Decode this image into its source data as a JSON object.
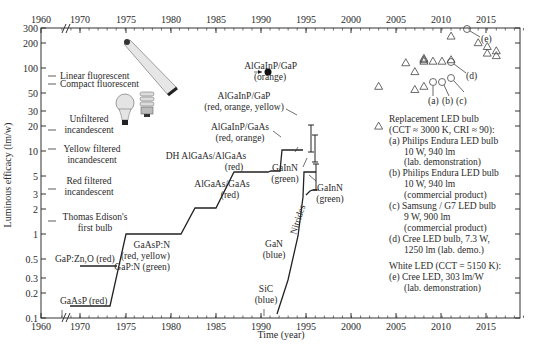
{
  "chart_data": {
    "type": "line",
    "title": "",
    "xlabel": "Time (year)",
    "ylabel": "Luminous efficacy (lm/w)",
    "y_scale": "log",
    "ylim": [
      0.1,
      300
    ],
    "xlim": [
      1960,
      2019
    ],
    "x_ticks": [
      "1960",
      "1970",
      "1975",
      "1980",
      "1985",
      "1990",
      "1995",
      "2000",
      "2005",
      "2010",
      "2015"
    ],
    "x_ticks_top": [
      "1960",
      "1970",
      "1975",
      "1980",
      "1985",
      "1990",
      "1995",
      "2000",
      "2005",
      "2010",
      "2015"
    ],
    "y_ticks": [
      "0.1",
      "0.2",
      "0.3",
      "0.5",
      "1",
      "2",
      "3",
      "5",
      "10",
      "20",
      "30",
      "50",
      "100",
      "200",
      "300"
    ],
    "axis_break": "between 1960 and 1970",
    "grid": false,
    "reference_lamps": [
      {
        "label": "Linear fluorescent",
        "value": 80
      },
      {
        "label": "Compact fluorescent",
        "value": 65
      },
      {
        "label": "Unfiltered incandescent",
        "value": 17
      },
      {
        "label": "Yellow filtered incandescent",
        "value": 10.5
      },
      {
        "label": "Red filtered incandescent",
        "value": 3.5
      },
      {
        "label": "Thomas Edison's first bulb",
        "value": 1.4
      }
    ],
    "series": [
      {
        "name": "Conventional LED (GaAsP → AlGaInP/GaP)",
        "points": [
          [
            1968,
            0.14
          ],
          [
            1973,
            0.14
          ],
          [
            1975,
            1
          ],
          [
            1981,
            1
          ],
          [
            1983,
            2
          ],
          [
            1986,
            2
          ],
          [
            1988,
            8
          ],
          [
            1992,
            8
          ],
          [
            1992.2,
            9
          ],
          [
            1993,
            9
          ],
          [
            1993.5,
            25
          ],
          [
            1997,
            25
          ]
        ]
      },
      {
        "name": "GaP:Zn,O (red)",
        "points": [
          [
            1969,
            0.4
          ],
          [
            1974,
            0.4
          ]
        ]
      },
      {
        "name": "Nitrides",
        "points": [
          [
            1992,
            0.12
          ],
          [
            1994,
            1.5
          ],
          [
            1995.5,
            10
          ],
          [
            1995.8,
            20
          ],
          [
            1997,
            20
          ]
        ]
      },
      {
        "name": "GaInN (green) lower",
        "points": [
          [
            1996,
            3
          ],
          [
            1996.5,
            5
          ],
          [
            1997,
            5
          ]
        ]
      }
    ],
    "error_bars": [
      {
        "x": 1997,
        "low": 25,
        "high": 50
      },
      {
        "x": 1997,
        "low": 10,
        "high": 20
      },
      {
        "x": 1997,
        "low": 5,
        "high": 15
      }
    ],
    "highlight_point": {
      "label": "AlGaInP/GaP (orange)",
      "x": 2000,
      "y": 100
    },
    "triangles": [
      [
        2003,
        20
      ],
      [
        2003,
        60
      ],
      [
        2006,
        115
      ],
      [
        2007,
        90
      ],
      [
        2007,
        55
      ],
      [
        2008,
        60
      ],
      [
        2008,
        130
      ],
      [
        2008,
        125
      ],
      [
        2008,
        120
      ],
      [
        2009,
        120
      ],
      [
        2010,
        120
      ],
      [
        2011,
        125
      ],
      [
        2011,
        240
      ],
      [
        2014,
        200
      ],
      [
        2015,
        180
      ],
      [
        2015,
        150
      ],
      [
        2016,
        160
      ],
      [
        2016,
        140
      ]
    ],
    "circles": [
      {
        "id": "(a)",
        "x": 2010,
        "y": 95
      },
      {
        "id": "(b)",
        "x": 2011,
        "y": 95
      },
      {
        "id": "(c)",
        "x": 2012,
        "y": 100
      },
      {
        "id": "(d)",
        "x": 2012,
        "y": 150
      },
      {
        "id": "(e)",
        "x": 2014,
        "y": 303
      }
    ],
    "annotations": [
      "GaAsP (red)",
      "GaP:Zn,O (red)",
      "GaAsP:N (red, yellow)",
      "GaP:N (green)",
      "AlGaAs/GaAs (red)",
      "DH AlGaAs/AlGaAs (red)",
      "AlGaInP/GaAs (red, orange)",
      "AlGaInP/GaP (red, orange, yellow)",
      "GaInN (green)",
      "GaN (blue)",
      "SiC (blue)",
      "Nitrides",
      "AlGaInP/GaP (orange)"
    ]
  },
  "labels": {
    "xlabel": "Time (year)",
    "ylabel": "Luminous efficacy (lm/w)",
    "lamps": {
      "linear": "Linear fluorescent",
      "compact": "Compact fluorescent",
      "unfiltered1": "Unfiltered",
      "unfiltered2": "incandescent",
      "yellow1": "Yellow filtered",
      "yellow2": "incandescent",
      "red1": "Red filtered",
      "red2": "incandescent",
      "edison1": "Thomas Edison's",
      "edison2": "first bulb"
    },
    "led": {
      "gaasp": "GaAsP (red)",
      "gapzno": "GaP:Zn,O (red)",
      "gaaspn1": "GaAsP:N",
      "gaaspn2": "(red, yellow)",
      "gaaspn3": "GaP:N (green)",
      "algaas1": "AlGaAs/GaAs",
      "algaas2": "(red)",
      "dh1": "DH AlGaAs/AlGaAs",
      "dh2": "(red)",
      "algainpgaas1": "AlGaInP/GaAs",
      "algainpgaas2": "(red, orange)",
      "algainpgap1": "AlGaInP/GaP",
      "algainpgap2": "(red, orange, yellow)",
      "orange1": "AlGaInP/GaP",
      "orange2": "(orange)",
      "gainn1a": "GaInN",
      "gainn1b": "(green)",
      "gainn2a": "GaInN",
      "gainn2b": "(green)",
      "gan1": "GaN",
      "gan2": "(blue)",
      "sic1": "SiC",
      "sic2": "(blue)",
      "nitrides": "Nitrides"
    },
    "points": {
      "a": "(a)",
      "b": "(b)",
      "c": "(c)",
      "d": "(d)",
      "e": "(e)"
    },
    "legend": [
      "Replacement LED bulb",
      "(CCT ≈ 3000 K, CRI ≈  90):",
      "(a) Philips Endura LED bulb",
      "10 W, 940 lm",
      "(lab. demonstration)",
      "(b) Philips Endura LED bulb",
      "10 W, 940 lm",
      "(commercial product)",
      "(c) Samsung / G7 LED bulb",
      "9 W, 900 lm",
      "(commercial product)",
      "(d) Cree LED bulb, 7.3 W,",
      "1250 lm (lab. demo.)",
      "White LED (CCT = 5150 K):",
      "(e) Cree LED, 303 lm/W",
      "(lab. demonstration)"
    ]
  },
  "ticks": {
    "x": [
      {
        "label": "1960",
        "px": 41
      },
      {
        "label": "1970",
        "px": 80
      },
      {
        "label": "1975",
        "px": 126
      },
      {
        "label": "1980",
        "px": 171
      },
      {
        "label": "1985",
        "px": 216
      },
      {
        "label": "1990",
        "px": 261
      },
      {
        "label": "1995",
        "px": 306
      },
      {
        "label": "2000",
        "px": 351
      },
      {
        "label": "2005",
        "px": 396
      },
      {
        "label": "2010",
        "px": 441
      },
      {
        "label": "2015",
        "px": 486
      }
    ],
    "y": [
      {
        "label": "0.1",
        "py": 318
      },
      {
        "label": "0.2",
        "py": 293
      },
      {
        "label": "0.3",
        "py": 278
      },
      {
        "label": "0.5",
        "py": 259
      },
      {
        "label": "1",
        "py": 234
      },
      {
        "label": "2",
        "py": 209
      },
      {
        "label": "3",
        "py": 194
      },
      {
        "label": "5",
        "py": 176
      },
      {
        "label": "10",
        "py": 151
      },
      {
        "label": "20",
        "py": 126
      },
      {
        "label": "30",
        "py": 111
      },
      {
        "label": "50",
        "py": 93
      },
      {
        "label": "100",
        "py": 68
      },
      {
        "label": "200",
        "py": 43
      },
      {
        "label": "300",
        "py": 28
      }
    ]
  },
  "colors": {
    "axis": "#333333",
    "line": "#222222",
    "text": "#2a2a2a",
    "marker": "#444444"
  }
}
